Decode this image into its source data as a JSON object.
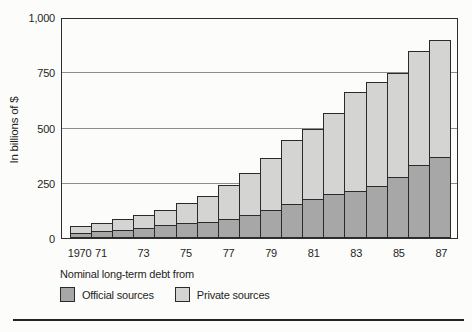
{
  "figure": {
    "background": "#fcfcfa",
    "axis_color": "#2e2e2e",
    "grid_color": "#8d8d8d"
  },
  "chart_data": {
    "type": "bar",
    "stacked": true,
    "title": "",
    "xlabel": "",
    "ylabel": "In billions of $",
    "ylim": [
      0,
      1000
    ],
    "grid": true,
    "yticks": [
      0,
      250,
      500,
      750,
      1000
    ],
    "ytick_labels": [
      "0",
      "250",
      "500",
      "750",
      "1,000"
    ],
    "categories": [
      "1970",
      "1971",
      "1972",
      "1973",
      "1974",
      "1975",
      "1976",
      "1977",
      "1978",
      "1979",
      "1980",
      "1981",
      "1982",
      "1983",
      "1984",
      "1985",
      "1986",
      "1987"
    ],
    "x_labels": [
      "1970",
      "71",
      "",
      "73",
      "",
      "75",
      "",
      "77",
      "",
      "79",
      "",
      "81",
      "",
      "83",
      "",
      "85",
      "",
      "87"
    ],
    "series": [
      {
        "name": "Official sources",
        "color": "#a7a7a7",
        "values": [
          25,
          30,
          38,
          46,
          57,
          68,
          72,
          87,
          105,
          128,
          155,
          178,
          198,
          212,
          236,
          277,
          332,
          368
        ]
      },
      {
        "name": "Private sources",
        "color": "#d4d4d2",
        "values": [
          32,
          42,
          53,
          61,
          76,
          94,
          121,
          158,
          193,
          237,
          293,
          318,
          374,
          452,
          476,
          473,
          518,
          532
        ]
      }
    ],
    "totals": [
      57,
      72,
      91,
      107,
      133,
      162,
      193,
      245,
      298,
      365,
      448,
      496,
      572,
      664,
      712,
      750,
      850,
      900
    ],
    "legend": {
      "title": "Nominal long-term debt from",
      "position": "bottom-left"
    }
  }
}
